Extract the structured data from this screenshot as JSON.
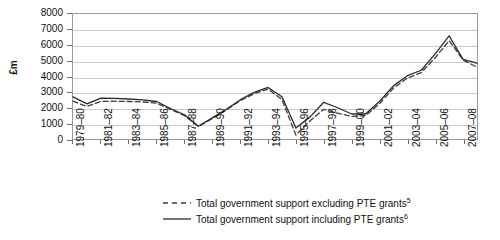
{
  "chart_data": {
    "type": "line",
    "title": "",
    "xlabel": "",
    "ylabel": "£m",
    "ylim": [
      0,
      8000
    ],
    "y_ticks": [
      0,
      1000,
      2000,
      3000,
      4000,
      5000,
      6000,
      7000,
      8000
    ],
    "y_tick_labels": [
      "0",
      "1000",
      "2000",
      "3000",
      "4000",
      "5000",
      "6000",
      "7000",
      "8000"
    ],
    "grid": true,
    "legend_position": "bottom",
    "categories": [
      "1979–80",
      "1980–81",
      "1981–82",
      "1982–83",
      "1983–84",
      "1984–85",
      "1985–86",
      "1986–87",
      "1987–88",
      "1988–89",
      "1989–90",
      "1990–91",
      "1991–92",
      "1992–93",
      "1993–94",
      "1994–95",
      "1995–96",
      "1996–97",
      "1997–98",
      "1998–99",
      "1999–00",
      "2000–01",
      "2001–02",
      "2002–03",
      "2003–04",
      "2004–05",
      "2005–06",
      "2006–07",
      "2007–08",
      "2008–09"
    ],
    "x_tick_labels": [
      "1979–80",
      "1981–82",
      "1983–84",
      "1985–86",
      "1987–88",
      "1989–90",
      "1991–92",
      "1993–94",
      "1995–96",
      "1997–98",
      "1999–00",
      "2001–02",
      "2003–04",
      "2005–06",
      "2007–08"
    ],
    "series": [
      {
        "name": "Total government support excluding PTE grants",
        "note_marker": "5",
        "style": "dashed",
        "color": "#3a3a3a",
        "values": [
          2420,
          2080,
          2400,
          2420,
          2400,
          2370,
          2300,
          1900,
          1500,
          800,
          1300,
          1850,
          2450,
          2900,
          3200,
          2520,
          250,
          1150,
          1900,
          1650,
          1450,
          1500,
          2250,
          3250,
          3900,
          4250,
          5200,
          6300,
          5050,
          4600
        ]
      },
      {
        "name": "Total government support including PTE grants",
        "note_marker": "6",
        "style": "solid",
        "color": "#2b2b2b",
        "values": [
          2700,
          2250,
          2620,
          2600,
          2560,
          2500,
          2400,
          1950,
          1550,
          820,
          1350,
          1900,
          2500,
          2980,
          3300,
          2700,
          700,
          1400,
          2350,
          2000,
          1600,
          1600,
          2400,
          3400,
          4050,
          4400,
          5450,
          6600,
          5100,
          4850
        ]
      }
    ]
  },
  "legend": {
    "items": [
      {
        "label": "Total government support excluding PTE grants",
        "marker": "5"
      },
      {
        "label": "Total government support including PTE grants",
        "marker": "6"
      }
    ]
  }
}
